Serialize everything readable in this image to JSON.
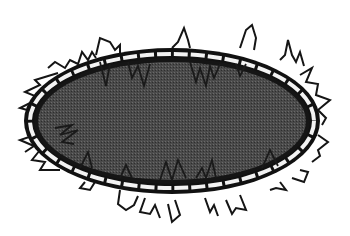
{
  "image": {
    "subject": "spiky-ellipse",
    "width": 350,
    "height": 236,
    "colors": {
      "background": "#ffffff",
      "fill": "#4a4a4a",
      "outline": "#111111",
      "stripe": "#f2f2f2"
    },
    "ellipse": {
      "cx": 172,
      "cy": 121,
      "rx": 146,
      "ry": 71
    }
  }
}
